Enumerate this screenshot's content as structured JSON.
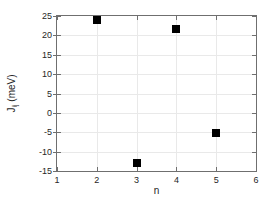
{
  "chart_data": {
    "type": "scatter",
    "title": "",
    "xlabel": "n",
    "ylabel": "J",
    "ylabel_sub": "ij",
    "ylabel_unit": " (meV)",
    "ylabel_full": "Jij (meV)",
    "x": [
      2,
      3,
      4,
      5
    ],
    "values": [
      24.0,
      -13.0,
      21.7,
      -5.1
    ],
    "series": [
      {
        "name": "Jij",
        "x": [
          2,
          3,
          4,
          5
        ],
        "values": [
          24.0,
          -13.0,
          21.7,
          -5.1
        ]
      }
    ],
    "xlim": [
      1,
      6
    ],
    "ylim": [
      -15,
      25
    ],
    "xticks": [
      1,
      2,
      3,
      4,
      5,
      6
    ],
    "yticks": [
      -15,
      -10,
      -5,
      0,
      5,
      10,
      15,
      20,
      25
    ],
    "xticklabels": [
      "1",
      "2",
      "3",
      "4",
      "5",
      "6"
    ],
    "yticklabels": [
      "-15",
      "-10",
      "-5",
      "0",
      "5",
      "10",
      "15",
      "20",
      "25"
    ],
    "grid": true,
    "legend": false,
    "marker": "square",
    "marker_color": "#000000",
    "grid_color": "#e9e9e9",
    "axis_color": "#6f6f6f",
    "background_color": "#ffffff"
  }
}
